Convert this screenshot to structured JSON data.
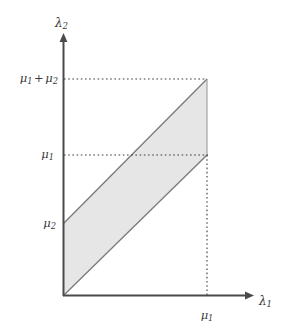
{
  "figure": {
    "kind": "math-diagram",
    "background_color": "#ffffff",
    "axis_color": "#4a4a4a",
    "region_fill_color": "#e6e6e6",
    "region_border_color": "#7a7a7a",
    "guide_line_color": "#3b3b3b"
  },
  "axes": {
    "x": {
      "label_base": "λ",
      "label_sub": "1",
      "origin_px": {
        "x": 63,
        "y": 296
      },
      "arrow_tip_px": {
        "x": 253,
        "y": 296
      }
    },
    "y": {
      "label_base": "λ",
      "label_sub": "2",
      "origin_px": {
        "x": 63,
        "y": 296
      },
      "arrow_tip_px": {
        "x": 63,
        "y": 34
      }
    }
  },
  "ticks": {
    "y_axis": [
      {
        "id": "mu1-plus-mu2",
        "base": "μ",
        "sub": "1",
        "op": "+",
        "base2": "μ",
        "sub2": "2",
        "y_px": 79
      },
      {
        "id": "mu1",
        "base": "μ",
        "sub": "1",
        "y_px": 155
      },
      {
        "id": "mu2",
        "base": "μ",
        "sub": "2",
        "y_px": 224
      }
    ],
    "x_axis": [
      {
        "id": "mu1",
        "base": "μ",
        "sub": "1",
        "x_px": 207
      }
    ]
  },
  "guide_lines": [
    {
      "id": "guide-mu1-plus-mu2",
      "orientation": "horizontal",
      "y_px": 79,
      "x_start_px": 64,
      "x_end_px": 207
    },
    {
      "id": "guide-mu1",
      "orientation": "horizontal",
      "y_px": 155,
      "x_start_px": 64,
      "x_end_px": 207
    },
    {
      "id": "guide-mu1-vertical",
      "orientation": "vertical",
      "x_px": 207,
      "y_start_px": 155,
      "y_end_px": 296
    }
  ],
  "shaded_region": {
    "name": "feasible-parallelogram",
    "vertices_px": [
      {
        "x": 63,
        "y": 296
      },
      {
        "x": 207,
        "y": 155
      },
      {
        "x": 207,
        "y": 79
      },
      {
        "x": 63,
        "y": 224
      }
    ],
    "points_attr": "63,296 207,155 207,79 63,224"
  }
}
